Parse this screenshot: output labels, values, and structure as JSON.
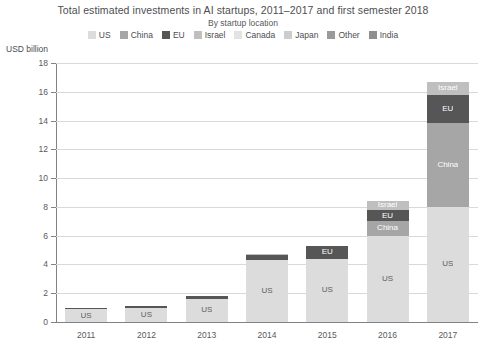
{
  "chart_data": {
    "type": "bar",
    "stacked": true,
    "title": "Total estimated investments in AI startups, 2011–2017 and first semester 2018",
    "subtitle": "By startup location",
    "ylabel": "USD billion",
    "xlabel": "",
    "ylim": [
      0,
      18
    ],
    "ytick_step": 2,
    "yticks": [
      "0",
      "2",
      "4",
      "6",
      "8",
      "10",
      "12",
      "14",
      "16",
      "18"
    ],
    "grid": true,
    "legend_position": "top",
    "categories": [
      "2011",
      "2012",
      "2013",
      "2014",
      "2015",
      "2016",
      "2017"
    ],
    "series": [
      {
        "name": "US",
        "color": "#dcdcdc",
        "values": [
          0.9,
          1.0,
          1.6,
          4.3,
          4.4,
          6.0,
          8.0
        ]
      },
      {
        "name": "China",
        "color": "#a6a6a6",
        "values": [
          0.0,
          0.0,
          0.0,
          0.0,
          0.0,
          1.0,
          5.8
        ]
      },
      {
        "name": "EU",
        "color": "#565656",
        "values": [
          0.1,
          0.1,
          0.2,
          0.35,
          0.9,
          0.8,
          2.0
        ]
      },
      {
        "name": "Israel",
        "color": "#bfbfbf",
        "values": [
          0.0,
          0.0,
          0.0,
          0.05,
          0.0,
          0.6,
          0.9
        ]
      },
      {
        "name": "Canada",
        "color": "#e3e3e3",
        "values": [
          0.0,
          0.0,
          0.0,
          0.0,
          0.0,
          0.0,
          0.0
        ]
      },
      {
        "name": "Japan",
        "color": "#cdcdcd",
        "values": [
          0.0,
          0.0,
          0.0,
          0.0,
          0.0,
          0.0,
          0.0
        ]
      },
      {
        "name": "Other",
        "color": "#9a9a9a",
        "values": [
          0.0,
          0.0,
          0.0,
          0.0,
          0.0,
          0.0,
          0.0
        ]
      },
      {
        "name": "India",
        "color": "#8f8f8f",
        "values": [
          0.0,
          0.0,
          0.0,
          0.0,
          0.0,
          0.0,
          0.0
        ]
      }
    ],
    "totals": [
      1.0,
      1.1,
      1.8,
      4.7,
      5.3,
      8.4,
      16.7
    ],
    "segment_labels": {
      "2011": [
        "US"
      ],
      "2012": [
        "US"
      ],
      "2013": [
        "US"
      ],
      "2014": [
        "US"
      ],
      "2015": [
        "US",
        "EU"
      ],
      "2016": [
        "US",
        "China",
        "EU",
        "Israel"
      ],
      "2017": [
        "US",
        "China",
        "EU",
        "Israel"
      ]
    }
  },
  "legend": {
    "items": [
      {
        "label": "US",
        "color": "#dcdcdc"
      },
      {
        "label": "China",
        "color": "#a6a6a6"
      },
      {
        "label": "EU",
        "color": "#565656"
      },
      {
        "label": "Israel",
        "color": "#bfbfbf"
      },
      {
        "label": "Canada",
        "color": "#e3e3e3"
      },
      {
        "label": "Japan",
        "color": "#cdcdcd"
      },
      {
        "label": "Other",
        "color": "#9a9a9a"
      },
      {
        "label": "India",
        "color": "#8f8f8f"
      }
    ]
  },
  "colors": {
    "grid": "#d9d9d9",
    "axis": "#808285",
    "text": "#58595b",
    "background": "#ffffff"
  }
}
